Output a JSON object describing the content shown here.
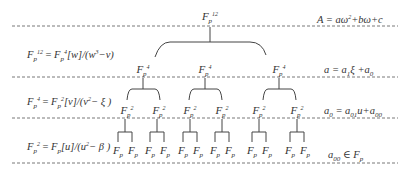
{
  "diagram": {
    "levels": [
      {
        "level": 0,
        "node_label": "F",
        "sub": "p",
        "sup": "12",
        "count": 1
      },
      {
        "level": 1,
        "node_label": "F",
        "sub": "p",
        "sup": "4",
        "count": 3
      },
      {
        "level": 2,
        "node_label": "F",
        "sub": "p",
        "sup": "2",
        "count": 6
      },
      {
        "level": 3,
        "node_label": "F",
        "sub": "p",
        "sup": "",
        "count": 12
      }
    ],
    "left_equations": [
      {
        "lhs_F": "F",
        "lhs_sub": "p",
        "lhs_sup": "12",
        "eq": " = ",
        "rhs_F": "F",
        "rhs_sub": "p",
        "rhs_sup": "4",
        "rest": "[w]/(w",
        "pow": "3",
        "tail": "−v)"
      },
      {
        "lhs_F": "F",
        "lhs_sub": "p",
        "lhs_sup": "4",
        "eq": " = ",
        "rhs_F": "F",
        "rhs_sub": "p",
        "rhs_sup": "2",
        "rest": "[v]/(v",
        "pow": "2",
        "tail": "− ξ )"
      },
      {
        "lhs_F": "F",
        "lhs_sub": "p",
        "lhs_sup": "2",
        "eq": " = ",
        "rhs_F": "F",
        "rhs_sub": "p",
        "rhs_sup": "",
        "rest": "[u]/(u",
        "pow": "2",
        "tail": "− β )"
      }
    ],
    "right_equations": [
      {
        "a": "A = aω",
        "pow": "2",
        "b": "+bω+c"
      },
      {
        "a": "a = a",
        "sub1": "1",
        "b": "ξ +a",
        "sub2": "0"
      },
      {
        "a": "a",
        "sub0": "0",
        "b": " = a",
        "sub1": "01",
        "c": "u+a",
        "sub2": "00"
      },
      {
        "a": "a",
        "sub0": "00",
        "b": " ∈ F",
        "sub1": "p"
      }
    ]
  }
}
